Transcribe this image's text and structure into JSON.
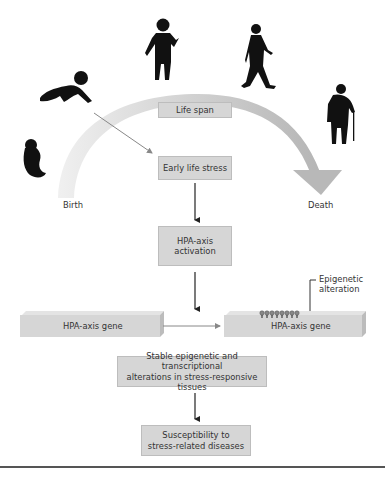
{
  "figure": {
    "arc": {
      "color_start": "#eeeeee",
      "color_end": "#b9b9b9",
      "direction": "birth-to-death"
    },
    "life_stages": [
      "fetus-icon",
      "crawling-baby-icon",
      "child-icon",
      "walking-adult-icon",
      "elderly-with-cane-icon"
    ],
    "labels": {
      "life_span": "Life span",
      "birth": "Birth",
      "death": "Death",
      "epigenetic_line1": "Epigenetic",
      "epigenetic_line2": "alteration"
    },
    "flow": {
      "early_life_stress": "Early life stress",
      "hpa_activation_line1": "HPA-axis",
      "hpa_activation_line2": "activation",
      "gene_left": "HPA-axis gene",
      "gene_right": "HPA-axis gene",
      "stable_line1": "Stable epigenetic and transcriptional",
      "stable_line2": "alterations in stress-responsive tissues",
      "susceptibility_line1": "Susceptibility to",
      "susceptibility_line2": "stress-related diseases"
    },
    "methyl_marks_count": 8,
    "colors": {
      "box_fill": "#d6d6d6",
      "arrow": "#222222",
      "gray_arrow": "#888888",
      "silhouette": "#111111"
    }
  }
}
